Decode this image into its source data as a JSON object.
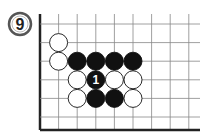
{
  "problem": {
    "number": "9"
  },
  "board": {
    "columns": 9,
    "rows": 7,
    "edges": [
      "left",
      "bottom"
    ],
    "colors": {
      "black": "#111111",
      "white": "#ffffff",
      "line": "#444444",
      "edge": "#222222"
    }
  },
  "stones": [
    {
      "color": "white",
      "col": 1,
      "row": 1,
      "label": ""
    },
    {
      "color": "white",
      "col": 1,
      "row": 2,
      "label": ""
    },
    {
      "color": "black",
      "col": 2,
      "row": 2,
      "label": ""
    },
    {
      "color": "black",
      "col": 3,
      "row": 2,
      "label": ""
    },
    {
      "color": "black",
      "col": 4,
      "row": 2,
      "label": ""
    },
    {
      "color": "black",
      "col": 5,
      "row": 2,
      "label": ""
    },
    {
      "color": "white",
      "col": 2,
      "row": 3,
      "label": ""
    },
    {
      "color": "black",
      "col": 3,
      "row": 3,
      "label": "1"
    },
    {
      "color": "white",
      "col": 4,
      "row": 3,
      "label": ""
    },
    {
      "color": "white",
      "col": 5,
      "row": 3,
      "label": ""
    },
    {
      "color": "white",
      "col": 2,
      "row": 4,
      "label": ""
    },
    {
      "color": "black",
      "col": 3,
      "row": 4,
      "label": ""
    },
    {
      "color": "black",
      "col": 4,
      "row": 4,
      "label": ""
    },
    {
      "color": "white",
      "col": 5,
      "row": 4,
      "label": ""
    }
  ]
}
